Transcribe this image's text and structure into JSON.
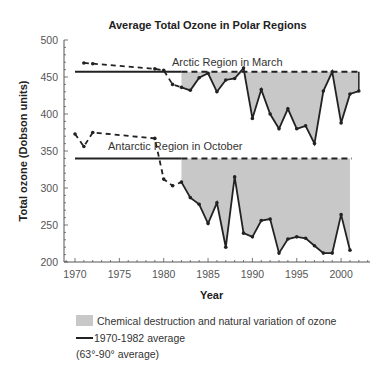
{
  "chart_data": {
    "type": "line",
    "title": "Average Total Ozone in Polar Regions",
    "xlabel": "Year",
    "ylabel": "Total ozone (Dobson units)",
    "xlim": [
      1969,
      2003
    ],
    "ylim": [
      200,
      500
    ],
    "x_ticks": [
      1970,
      1975,
      1980,
      1985,
      1990,
      1995,
      2000
    ],
    "y_ticks": [
      200,
      250,
      300,
      350,
      400,
      450,
      500
    ],
    "series": [
      {
        "name": "Arctic Region in March",
        "average_1970_1982": 457,
        "points": [
          [
            1971,
            469
          ],
          [
            1972,
            468
          ],
          [
            1979,
            461
          ],
          [
            1980,
            459
          ],
          [
            1981,
            440
          ],
          [
            1982,
            436
          ],
          [
            1983,
            432
          ],
          [
            1984,
            449
          ],
          [
            1985,
            455
          ],
          [
            1986,
            430
          ],
          [
            1987,
            446
          ],
          [
            1988,
            448
          ],
          [
            1989,
            462
          ],
          [
            1990,
            394
          ],
          [
            1991,
            433
          ],
          [
            1992,
            400
          ],
          [
            1993,
            380
          ],
          [
            1994,
            407
          ],
          [
            1995,
            380
          ],
          [
            1996,
            384
          ],
          [
            1997,
            360
          ],
          [
            1998,
            431
          ],
          [
            1999,
            457
          ],
          [
            2000,
            388
          ],
          [
            2001,
            427
          ],
          [
            2002,
            431
          ]
        ],
        "dashed_until": 1982
      },
      {
        "name": "Antarctic Region in October",
        "average_1970_1982": 340,
        "points": [
          [
            1970,
            373
          ],
          [
            1971,
            356
          ],
          [
            1972,
            375
          ],
          [
            1979,
            367
          ],
          [
            1980,
            312
          ],
          [
            1981,
            303
          ],
          [
            1982,
            308
          ],
          [
            1983,
            287
          ],
          [
            1984,
            278
          ],
          [
            1985,
            252
          ],
          [
            1986,
            280
          ],
          [
            1987,
            220
          ],
          [
            1988,
            315
          ],
          [
            1989,
            239
          ],
          [
            1990,
            234
          ],
          [
            1991,
            256
          ],
          [
            1992,
            258
          ],
          [
            1993,
            212
          ],
          [
            1994,
            231
          ],
          [
            1995,
            234
          ],
          [
            1996,
            232
          ],
          [
            1997,
            222
          ],
          [
            1998,
            212
          ],
          [
            1999,
            212
          ],
          [
            2000,
            264
          ],
          [
            2001,
            216
          ]
        ],
        "dashed_until": 1982
      }
    ],
    "legend": [
      {
        "type": "area",
        "label": "Chemical destruction and natural variation of ozone",
        "color": "#c8c8c8"
      },
      {
        "type": "line",
        "label": "1970-1982 average",
        "color": "#222222"
      }
    ],
    "note": "(63°-90° average)",
    "grid": false
  },
  "labels": {
    "title": "Average Total Ozone in Polar Regions",
    "xlabel": "Year",
    "ylabel": "Total ozone (Dobson units)",
    "arctic": "Arctic Region in March",
    "antarctic": "Antarctic Region in October",
    "legend_area": "Chemical destruction and natural variation of ozone",
    "legend_line": "1970-1982 average",
    "note": "(63°-90° average)"
  },
  "colors": {
    "fill": "#c8c8c8",
    "line": "#222222",
    "axis": "#555555"
  }
}
